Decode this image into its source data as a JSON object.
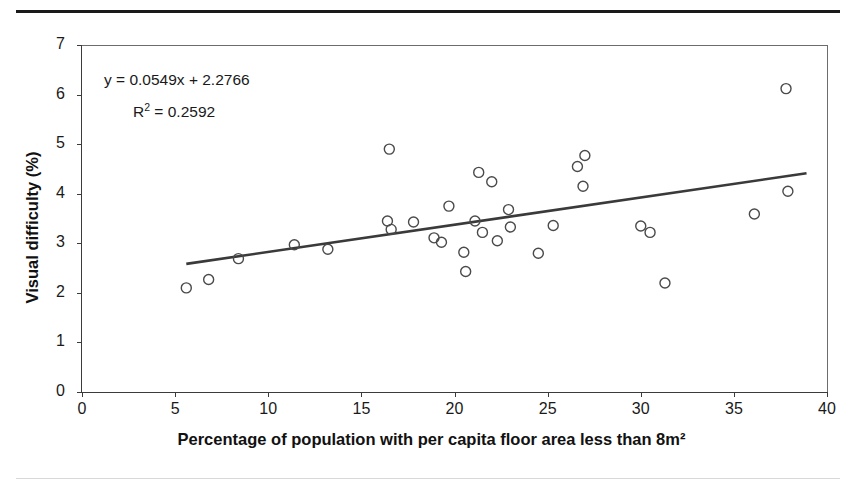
{
  "figure": {
    "top_rule": "horizontal-rule",
    "bottom_rule": "horizontal-rule"
  },
  "chart_data": {
    "type": "scatter",
    "title": "",
    "xlabel": "Percentage of population with per capita floor area less than 8m²",
    "ylabel": "Visual difficulty (%)",
    "xlim": [
      0,
      40
    ],
    "ylim": [
      0,
      7
    ],
    "xticks": [
      0,
      5,
      10,
      15,
      20,
      25,
      30,
      35,
      40
    ],
    "yticks": [
      0,
      1,
      2,
      3,
      4,
      5,
      6,
      7
    ],
    "xticklabels": [
      "0",
      "5",
      "10",
      "15",
      "20",
      "25",
      "30",
      "35",
      "40"
    ],
    "yticklabels": [
      "0",
      "1",
      "2",
      "3",
      "4",
      "5",
      "6",
      "7"
    ],
    "grid": false,
    "legend": "none",
    "marker_style": "open-circle",
    "points": [
      [
        5.6,
        2.1
      ],
      [
        6.8,
        2.27
      ],
      [
        8.4,
        2.69
      ],
      [
        11.4,
        2.97
      ],
      [
        13.2,
        2.88
      ],
      [
        16.4,
        3.45
      ],
      [
        16.5,
        4.9
      ],
      [
        16.6,
        3.28
      ],
      [
        17.8,
        3.43
      ],
      [
        18.9,
        3.11
      ],
      [
        19.3,
        3.02
      ],
      [
        19.7,
        3.75
      ],
      [
        20.5,
        2.82
      ],
      [
        20.6,
        2.43
      ],
      [
        21.1,
        3.45
      ],
      [
        21.3,
        4.43
      ],
      [
        21.5,
        3.22
      ],
      [
        22.0,
        4.24
      ],
      [
        22.3,
        3.05
      ],
      [
        22.9,
        3.68
      ],
      [
        23.0,
        3.33
      ],
      [
        24.5,
        2.8
      ],
      [
        25.3,
        3.36
      ],
      [
        26.6,
        4.55
      ],
      [
        26.9,
        4.15
      ],
      [
        27.0,
        4.77
      ],
      [
        30.0,
        3.35
      ],
      [
        30.5,
        3.22
      ],
      [
        31.3,
        2.2
      ],
      [
        36.1,
        3.59
      ],
      [
        37.8,
        6.12
      ],
      [
        37.9,
        4.05
      ]
    ],
    "trendline": {
      "equation_label": "y = 0.0549x + 2.2766",
      "r2_label": "R",
      "r2_sup": "2",
      "r2_value": "= 0.2592",
      "slope": 0.0549,
      "intercept": 2.2766,
      "r_squared": 0.2592,
      "x_start": 5.6,
      "x_end": 38.9
    },
    "annotations": [
      "y = 0.0549x + 2.2766",
      "R² = 0.2592"
    ]
  }
}
